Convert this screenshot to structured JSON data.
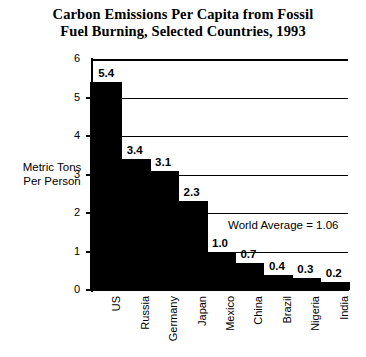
{
  "chart_data": {
    "type": "bar",
    "title": "Carbon Emissions Per Capita from Fossil Fuel Burning, Selected Countries, 1993",
    "title_line1": "Carbon Emissions Per Capita from Fossil",
    "title_line2": "Fuel Burning, Selected Countries, 1993",
    "categories": [
      "US",
      "Russia",
      "Germany",
      "Japan",
      "Mexico",
      "China",
      "Brazil",
      "Nigeria",
      "India"
    ],
    "values": [
      5.4,
      3.4,
      3.1,
      2.3,
      1.0,
      0.7,
      0.4,
      0.3,
      0.2
    ],
    "value_labels": [
      "5.4",
      "3.4",
      "3.1",
      "2.3",
      "1.0",
      "0.7",
      "0.4",
      "0.3",
      "0.2"
    ],
    "xlabel": "",
    "ylabel": "Metric Tons Per Person",
    "ylabel_line1": "Metric Tons",
    "ylabel_line2": "Per Person",
    "ylim": [
      0,
      6
    ],
    "yticks": [
      0,
      1,
      2,
      3,
      4,
      5,
      6
    ],
    "ytick_labels": [
      "0",
      "1",
      "2",
      "3",
      "4",
      "5",
      "6"
    ],
    "gridlines": [
      1,
      2,
      3,
      4,
      5,
      6
    ],
    "grid": true,
    "legend": false,
    "bar_color": "#000000",
    "annotations": [
      {
        "text": "World Average = 1.06",
        "value": 1.06
      }
    ]
  },
  "annotation": {
    "world_average_text": "World Average = 1.06"
  }
}
